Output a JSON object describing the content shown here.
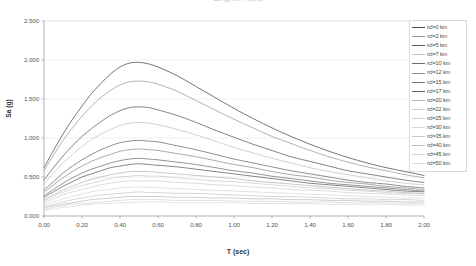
{
  "chart_title": "Sa (g) vs. T (sec)",
  "axes": {
    "xlabel": "T (sec)",
    "ylabel": "Sa (g)",
    "xticks": [
      "0.00",
      "0.20",
      "0.40",
      "0.60",
      "0.80",
      "1.00",
      "1.20",
      "1.40",
      "1.60",
      "1.80",
      "2.00"
    ],
    "yticks": [
      "2.500",
      "2.000",
      "1.500",
      "1.000",
      "0.500",
      "0.000"
    ]
  },
  "legend": {
    "items": [
      {
        "label": "rcl=0 km",
        "color": "#4a4a4a"
      },
      {
        "label": "rcl=2 km",
        "color": "#9a9a9a"
      },
      {
        "label": "rcl=5 km",
        "color": "#5c5c5c"
      },
      {
        "label": "rcl=7 km",
        "color": "#c2c2c2"
      },
      {
        "label": "rcl=10 km",
        "color": "#6b6b6b"
      },
      {
        "label": "rcl=12 km",
        "color": "#8d8d8d"
      },
      {
        "label": "rcl=15 km",
        "color": "#707070"
      },
      {
        "label": "rcl=17 km",
        "color": "#5f5f5f"
      },
      {
        "label": "rcl=20 km",
        "color": "#b5b5b5"
      },
      {
        "label": "rcl=22 km",
        "color": "#cccccc"
      },
      {
        "label": "rcl=25 km",
        "color": "#d2d2d2"
      },
      {
        "label": "rcl=30 km",
        "color": "#d8d8d8"
      },
      {
        "label": "rcl=35 km",
        "color": "#c8c8c8"
      },
      {
        "label": "rcl=40 km",
        "color": "#bdbdbd"
      },
      {
        "label": "rcl=45 km",
        "color": "#d5d5d5"
      },
      {
        "label": "rcl=50 km",
        "color": "#dcdcdc"
      }
    ]
  },
  "chart_data": {
    "type": "line",
    "title": "Sa (g) vs. T (sec)",
    "xlabel": "T (sec)",
    "ylabel": "Sa (g)",
    "xlim": [
      0.0,
      2.0
    ],
    "ylim": [
      0.0,
      2.5
    ],
    "grid": true,
    "legend_position": "right",
    "x": [
      0.0,
      0.05,
      0.1,
      0.15,
      0.2,
      0.25,
      0.3,
      0.35,
      0.4,
      0.45,
      0.5,
      0.55,
      0.6,
      0.7,
      0.8,
      0.9,
      1.0,
      1.1,
      1.2,
      1.3,
      1.4,
      1.5,
      1.6,
      1.7,
      1.8,
      1.9,
      2.0
    ],
    "series": [
      {
        "name": "rcl=0 km",
        "color": "#4a4a4a",
        "values": [
          0.62,
          0.84,
          1.05,
          1.24,
          1.41,
          1.57,
          1.7,
          1.82,
          1.91,
          1.96,
          1.97,
          1.95,
          1.91,
          1.8,
          1.66,
          1.52,
          1.38,
          1.25,
          1.13,
          1.02,
          0.92,
          0.83,
          0.75,
          0.68,
          0.62,
          0.57,
          0.52
        ]
      },
      {
        "name": "rcl=2 km",
        "color": "#9a9a9a",
        "values": [
          0.58,
          0.78,
          0.97,
          1.13,
          1.28,
          1.41,
          1.52,
          1.61,
          1.68,
          1.72,
          1.73,
          1.72,
          1.69,
          1.6,
          1.48,
          1.36,
          1.24,
          1.13,
          1.02,
          0.93,
          0.84,
          0.76,
          0.69,
          0.63,
          0.58,
          0.53,
          0.49
        ]
      },
      {
        "name": "rcl=5 km",
        "color": "#5c5c5c",
        "values": [
          0.46,
          0.62,
          0.77,
          0.9,
          1.02,
          1.12,
          1.21,
          1.29,
          1.35,
          1.39,
          1.4,
          1.39,
          1.36,
          1.29,
          1.2,
          1.1,
          1.01,
          0.92,
          0.84,
          0.76,
          0.7,
          0.64,
          0.58,
          0.54,
          0.5,
          0.46,
          0.43
        ]
      },
      {
        "name": "rcl=7 km",
        "color": "#c2c2c2",
        "values": [
          0.41,
          0.55,
          0.68,
          0.79,
          0.89,
          0.98,
          1.05,
          1.11,
          1.16,
          1.19,
          1.2,
          1.19,
          1.17,
          1.11,
          1.04,
          0.96,
          0.88,
          0.81,
          0.74,
          0.68,
          0.62,
          0.57,
          0.53,
          0.49,
          0.45,
          0.42,
          0.4
        ]
      },
      {
        "name": "rcl=10 km",
        "color": "#6b6b6b",
        "values": [
          0.33,
          0.44,
          0.55,
          0.64,
          0.72,
          0.79,
          0.85,
          0.9,
          0.94,
          0.96,
          0.97,
          0.96,
          0.95,
          0.9,
          0.85,
          0.79,
          0.73,
          0.68,
          0.63,
          0.58,
          0.54,
          0.5,
          0.46,
          0.43,
          0.41,
          0.38,
          0.36
        ]
      },
      {
        "name": "rcl=12 km",
        "color": "#8d8d8d",
        "values": [
          0.3,
          0.4,
          0.49,
          0.57,
          0.64,
          0.7,
          0.75,
          0.79,
          0.83,
          0.85,
          0.86,
          0.85,
          0.84,
          0.8,
          0.76,
          0.71,
          0.66,
          0.62,
          0.57,
          0.53,
          0.5,
          0.46,
          0.43,
          0.41,
          0.38,
          0.36,
          0.34
        ]
      },
      {
        "name": "rcl=15 km",
        "color": "#707070",
        "values": [
          0.26,
          0.34,
          0.42,
          0.49,
          0.55,
          0.6,
          0.64,
          0.68,
          0.71,
          0.73,
          0.74,
          0.73,
          0.72,
          0.69,
          0.66,
          0.62,
          0.58,
          0.55,
          0.51,
          0.48,
          0.45,
          0.42,
          0.4,
          0.38,
          0.36,
          0.34,
          0.32
        ]
      },
      {
        "name": "rcl=17 km",
        "color": "#5f5f5f",
        "values": [
          0.24,
          0.31,
          0.38,
          0.44,
          0.5,
          0.54,
          0.58,
          0.62,
          0.64,
          0.66,
          0.67,
          0.66,
          0.65,
          0.63,
          0.6,
          0.57,
          0.54,
          0.51,
          0.48,
          0.45,
          0.42,
          0.4,
          0.38,
          0.36,
          0.34,
          0.32,
          0.31
        ]
      },
      {
        "name": "rcl=20 km",
        "color": "#b5b5b5",
        "values": [
          0.21,
          0.27,
          0.33,
          0.38,
          0.43,
          0.47,
          0.5,
          0.53,
          0.55,
          0.57,
          0.57,
          0.57,
          0.56,
          0.54,
          0.52,
          0.5,
          0.48,
          0.45,
          0.43,
          0.41,
          0.39,
          0.37,
          0.35,
          0.33,
          0.32,
          0.3,
          0.29
        ]
      },
      {
        "name": "rcl=22 km",
        "color": "#cccccc",
        "values": [
          0.19,
          0.25,
          0.3,
          0.35,
          0.39,
          0.42,
          0.45,
          0.48,
          0.5,
          0.51,
          0.52,
          0.51,
          0.51,
          0.49,
          0.47,
          0.45,
          0.44,
          0.42,
          0.4,
          0.38,
          0.36,
          0.35,
          0.33,
          0.32,
          0.3,
          0.29,
          0.28
        ]
      },
      {
        "name": "rcl=25 km",
        "color": "#d2d2d2",
        "values": [
          0.17,
          0.22,
          0.27,
          0.31,
          0.34,
          0.37,
          0.4,
          0.42,
          0.44,
          0.45,
          0.45,
          0.45,
          0.45,
          0.43,
          0.42,
          0.4,
          0.39,
          0.37,
          0.36,
          0.34,
          0.33,
          0.32,
          0.3,
          0.29,
          0.28,
          0.27,
          0.26
        ]
      },
      {
        "name": "rcl=30 km",
        "color": "#d8d8d8",
        "values": [
          0.14,
          0.18,
          0.22,
          0.25,
          0.28,
          0.31,
          0.33,
          0.34,
          0.36,
          0.37,
          0.37,
          0.37,
          0.36,
          0.35,
          0.34,
          0.33,
          0.32,
          0.31,
          0.3,
          0.29,
          0.28,
          0.27,
          0.26,
          0.25,
          0.24,
          0.23,
          0.23
        ]
      },
      {
        "name": "rcl=35 km",
        "color": "#c8c8c8",
        "values": [
          0.12,
          0.15,
          0.18,
          0.21,
          0.23,
          0.25,
          0.27,
          0.28,
          0.29,
          0.3,
          0.31,
          0.3,
          0.3,
          0.29,
          0.29,
          0.28,
          0.27,
          0.26,
          0.25,
          0.25,
          0.24,
          0.23,
          0.22,
          0.22,
          0.21,
          0.21,
          0.2
        ]
      },
      {
        "name": "rcl=40 km",
        "color": "#bdbdbd",
        "values": [
          0.1,
          0.13,
          0.15,
          0.17,
          0.19,
          0.21,
          0.22,
          0.23,
          0.24,
          0.25,
          0.25,
          0.25,
          0.25,
          0.24,
          0.24,
          0.23,
          0.23,
          0.22,
          0.22,
          0.21,
          0.21,
          0.2,
          0.2,
          0.19,
          0.19,
          0.18,
          0.18
        ]
      },
      {
        "name": "rcl=45 km",
        "color": "#d5d5d5",
        "values": [
          0.08,
          0.11,
          0.13,
          0.15,
          0.16,
          0.17,
          0.18,
          0.19,
          0.2,
          0.21,
          0.21,
          0.21,
          0.21,
          0.2,
          0.2,
          0.2,
          0.19,
          0.19,
          0.19,
          0.18,
          0.18,
          0.18,
          0.17,
          0.17,
          0.17,
          0.16,
          0.16
        ]
      },
      {
        "name": "rcl=50 km",
        "color": "#dcdcdc",
        "values": [
          0.07,
          0.09,
          0.11,
          0.12,
          0.14,
          0.15,
          0.16,
          0.16,
          0.17,
          0.17,
          0.18,
          0.18,
          0.18,
          0.17,
          0.17,
          0.17,
          0.17,
          0.16,
          0.16,
          0.16,
          0.16,
          0.15,
          0.15,
          0.15,
          0.15,
          0.14,
          0.14
        ]
      }
    ]
  }
}
